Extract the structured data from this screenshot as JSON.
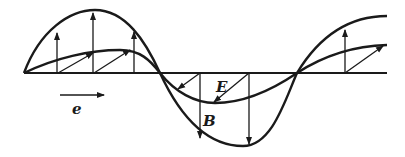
{
  "diagram": {
    "type": "electromagnetic-wave",
    "labels": {
      "electric_field": "E",
      "magnetic_field": "B",
      "direction": "e"
    },
    "colors": {
      "line": "#1a1a1a",
      "background": "#ffffff"
    },
    "curves": [
      {
        "name": "B-wave",
        "description": "large amplitude sinusoid, vertical field vectors"
      },
      {
        "name": "E-wave",
        "description": "small amplitude sinusoid, oblique field vectors"
      }
    ]
  }
}
